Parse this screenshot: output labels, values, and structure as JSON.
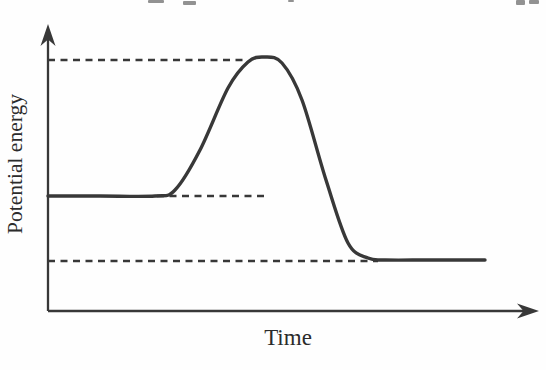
{
  "figure": {
    "background": "#fefefe",
    "ink_color": "#383838",
    "text_color": "#2b2b2b"
  },
  "chart_data": {
    "type": "line",
    "title": "",
    "xlabel": "Time",
    "ylabel": "Potential energy",
    "x_ticks": [],
    "y_ticks": [],
    "legend": null,
    "grid": false,
    "axes": {
      "origin_px": [
        48,
        311
      ],
      "x_arrow_tip_px": [
        539,
        311
      ],
      "y_arrow_tip_px": [
        48,
        24
      ],
      "has_arrowheads": true,
      "has_tick_marks": false
    },
    "series": [
      {
        "name": "potential-energy-curve",
        "style": "solid",
        "stroke_width": 3.4,
        "points_px": [
          [
            48,
            196
          ],
          [
            100,
            196
          ],
          [
            155,
            196
          ],
          [
            175,
            190
          ],
          [
            200,
            150
          ],
          [
            228,
            88
          ],
          [
            248,
            62
          ],
          [
            264,
            57
          ],
          [
            282,
            63
          ],
          [
            302,
            100
          ],
          [
            326,
            180
          ],
          [
            348,
            243
          ],
          [
            368,
            258
          ],
          [
            385,
            260
          ],
          [
            430,
            260
          ],
          [
            485,
            260
          ]
        ]
      }
    ],
    "reference_lines": [
      {
        "name": "peak-level-guide",
        "style": "dashed",
        "from_px": [
          48,
          60
        ],
        "to_px": [
          247,
          60
        ]
      },
      {
        "name": "initial-level-guide",
        "style": "dashed",
        "from_px": [
          157,
          196
        ],
        "to_px": [
          268,
          196
        ]
      },
      {
        "name": "final-level-guide",
        "style": "dashed",
        "from_px": [
          48,
          261
        ],
        "to_px": [
          378,
          261
        ]
      }
    ],
    "relative_levels": {
      "initial_level_y_px": 196,
      "peak_level_y_px": 58,
      "final_level_y_px": 260
    }
  },
  "artifacts": [
    {
      "x": 148,
      "y": 0,
      "w": 16,
      "h": 3
    },
    {
      "x": 183,
      "y": 1,
      "w": 13,
      "h": 4
    },
    {
      "x": 288,
      "y": 0,
      "w": 6,
      "h": 2
    },
    {
      "x": 516,
      "y": 0,
      "w": 9,
      "h": 5
    },
    {
      "x": 529,
      "y": 0,
      "w": 10,
      "h": 4
    }
  ]
}
